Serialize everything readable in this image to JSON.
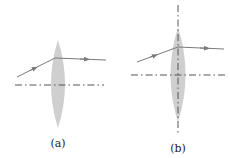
{
  "figure": {
    "panels": [
      {
        "id": "a",
        "label": "(a)",
        "elements": [
          "converging lens",
          "optical axis (dash-dot)",
          "incident ray with arrow",
          "refracted ray with arrow"
        ]
      },
      {
        "id": "b",
        "label": "(b)",
        "elements": [
          "converging lens",
          "optical axis (dash-dot)",
          "vertical principal plane (dash-dot)",
          "incident ray with arrow",
          "refracted ray with arrow"
        ]
      }
    ],
    "colors": {
      "lens_fill": "#c8c8c8",
      "ray": "#7a7a7a",
      "axis": "#555555",
      "label": "#222222"
    }
  }
}
